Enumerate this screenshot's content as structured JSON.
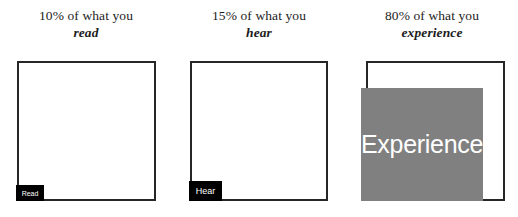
{
  "chart_data": {
    "type": "bar",
    "title": "",
    "subtitle": "",
    "xlabel": "",
    "ylabel": "",
    "ylim": [
      0,
      100
    ],
    "grid": false,
    "legend": "none",
    "orientation": "vertical",
    "categories": [
      "read",
      "hear",
      "experience"
    ],
    "values": [
      10,
      15,
      80
    ],
    "value_unit": "%",
    "tick_labels": [],
    "annotations": [
      "10% of what you read",
      "15% of what you hear",
      "80% of what you experience"
    ],
    "series": [
      {
        "name": "retention",
        "values": [
          10,
          15,
          80
        ]
      }
    ]
  },
  "colors": {
    "background": "#ffffff",
    "box_border": "#262626",
    "fill_small": "#000000",
    "fill_large": "#808080",
    "fill_label_text": "#ffffff",
    "caption_text": "#1c1c1c"
  },
  "panels": [
    {
      "key": "read",
      "caption_line1": "10% of what you",
      "caption_line2": "read",
      "percent": "10%",
      "fill_label": "Read"
    },
    {
      "key": "hear",
      "caption_line1": "15% of what you",
      "caption_line2": "hear",
      "percent": "15%",
      "fill_label": "Hear"
    },
    {
      "key": "experience",
      "caption_line1": "80% of what you",
      "caption_line2": "experience",
      "percent": "80%",
      "fill_label": "Experience"
    }
  ]
}
